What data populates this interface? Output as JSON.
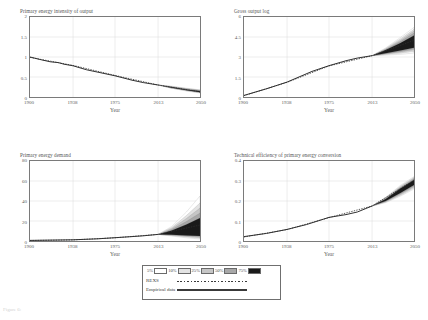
{
  "figure": {
    "caption": "Figure 6:"
  },
  "legend": {
    "name": "fan-chart-legend",
    "percentiles": [
      {
        "label": "5%",
        "color": "#ffffff"
      },
      {
        "label": "10%",
        "color": "#e3e3e3"
      },
      {
        "label": "25%",
        "color": "#c6c6c6"
      },
      {
        "label": "50%",
        "color": "#a8a8a8"
      },
      {
        "label": "75%",
        "color": "#1a1a1a"
      }
    ],
    "series": [
      {
        "label": "REXS",
        "style": "dotted"
      },
      {
        "label": "Empirical data",
        "style": "solid"
      }
    ]
  },
  "chart_data": [
    {
      "id": "primary-energy-intensity",
      "type": "line",
      "title": "Primary energy intensity of output",
      "xlabel": "Year",
      "ylabel": "",
      "xlim": [
        1900,
        2050
      ],
      "ylim": [
        0,
        2
      ],
      "xticks": [
        1900,
        1938,
        1975,
        2013,
        2050
      ],
      "yticks": [
        "0",
        "0.5",
        "1",
        "1.5",
        "2"
      ],
      "grid": true,
      "legend": "external",
      "series": [
        {
          "name": "Empirical data",
          "style": "solid",
          "x": [
            1900,
            1910,
            1918,
            1925,
            1930,
            1938,
            1950,
            1960,
            1975,
            1990,
            2000,
            2013
          ],
          "values": [
            1.0,
            0.93,
            0.88,
            0.86,
            0.82,
            0.78,
            0.68,
            0.62,
            0.53,
            0.42,
            0.36,
            0.3
          ]
        },
        {
          "name": "REXS",
          "style": "dotted",
          "x": [
            1900,
            1938,
            1975,
            2013,
            2050
          ],
          "values": [
            0.99,
            0.79,
            0.54,
            0.3,
            0.13
          ]
        }
      ],
      "fan": {
        "x": [
          2013,
          2025,
          2038,
          2050
        ],
        "bands": {
          "p75": {
            "lower": [
              0.3,
              0.23,
              0.17,
              0.12
            ],
            "upper": [
              0.3,
              0.25,
              0.19,
              0.15
            ]
          },
          "p50": {
            "lower": [
              0.3,
              0.23,
              0.17,
              0.12
            ],
            "upper": [
              0.3,
              0.25,
              0.2,
              0.16
            ]
          },
          "p25": {
            "lower": [
              0.3,
              0.22,
              0.16,
              0.11
            ],
            "upper": [
              0.3,
              0.26,
              0.21,
              0.17
            ]
          },
          "p10": {
            "lower": [
              0.3,
              0.22,
              0.16,
              0.11
            ],
            "upper": [
              0.3,
              0.26,
              0.21,
              0.17
            ]
          },
          "p5": {
            "lower": [
              0.3,
              0.22,
              0.15,
              0.1
            ],
            "upper": [
              0.3,
              0.27,
              0.22,
              0.18
            ]
          }
        }
      }
    },
    {
      "id": "gross-output-log",
      "type": "line",
      "title": "Gross output log",
      "xlabel": "Year",
      "ylabel": "",
      "xlim": [
        1900,
        2050
      ],
      "ylim": [
        0,
        6
      ],
      "xticks": [
        1900,
        1938,
        1975,
        2013,
        2050
      ],
      "yticks": [
        "0",
        "1.5",
        "3",
        "4.5",
        "6"
      ],
      "grid": true,
      "legend": "external",
      "series": [
        {
          "name": "Empirical data",
          "style": "solid",
          "x": [
            1900,
            1920,
            1938,
            1960,
            1975,
            1990,
            2000,
            2013
          ],
          "values": [
            0.12,
            0.62,
            1.12,
            1.92,
            2.35,
            2.72,
            2.92,
            3.1
          ]
        },
        {
          "name": "REXS",
          "style": "dotted",
          "x": [
            1900,
            1938,
            1975,
            2013,
            2050
          ],
          "values": [
            0.1,
            1.1,
            2.33,
            3.1,
            4.25
          ]
        }
      ],
      "fan": {
        "x": [
          2013,
          2025,
          2038,
          2050
        ],
        "bands": {
          "p75": {
            "lower": [
              3.1,
              3.28,
              3.48,
              3.7
            ],
            "upper": [
              3.1,
              3.52,
              4.05,
              4.62
            ]
          },
          "p50": {
            "lower": [
              3.1,
              3.25,
              3.42,
              3.6
            ],
            "upper": [
              3.1,
              3.56,
              4.16,
              4.8
            ]
          },
          "p25": {
            "lower": [
              3.1,
              3.22,
              3.36,
              3.52
            ],
            "upper": [
              3.1,
              3.6,
              4.26,
              4.95
            ]
          },
          "p10": {
            "lower": [
              3.1,
              3.18,
              3.28,
              3.42
            ],
            "upper": [
              3.1,
              3.64,
              4.36,
              5.08
            ]
          },
          "p5": {
            "lower": [
              3.1,
              3.14,
              3.2,
              3.3
            ],
            "upper": [
              3.1,
              3.68,
              4.46,
              5.22
            ]
          }
        }
      }
    },
    {
      "id": "primary-energy-demand",
      "type": "line",
      "title": "Primary energy demand",
      "xlabel": "Year",
      "ylabel": "",
      "xlim": [
        1900,
        2050
      ],
      "ylim": [
        0,
        80
      ],
      "xticks": [
        1900,
        1938,
        1975,
        2013,
        2050
      ],
      "yticks": [
        "0",
        "20",
        "40",
        "60",
        "80"
      ],
      "grid": true,
      "legend": "external",
      "series": [
        {
          "name": "Empirical data",
          "style": "solid",
          "x": [
            1900,
            1938,
            1960,
            1975,
            1990,
            2000,
            2013
          ],
          "values": [
            0.6,
            1.2,
            2.2,
            3.3,
            4.4,
            5.2,
            6.6
          ]
        },
        {
          "name": "REXS",
          "style": "dotted",
          "x": [
            1900,
            1938,
            1975,
            2013,
            2050
          ],
          "values": [
            0.5,
            1.1,
            3.2,
            6.6,
            16.0
          ]
        }
      ],
      "fan": {
        "x": [
          2013,
          2025,
          2038,
          2050
        ],
        "bands": {
          "p75": {
            "lower": [
              6.6,
              6.2,
              5.6,
              5.0
            ],
            "upper": [
              6.6,
              10.5,
              16.5,
              23.0
            ]
          },
          "p50": {
            "lower": [
              6.6,
              6.0,
              5.2,
              4.4
            ],
            "upper": [
              6.6,
              11.5,
              19.5,
              28.0
            ]
          },
          "p25": {
            "lower": [
              6.6,
              5.7,
              4.6,
              3.6
            ],
            "upper": [
              6.6,
              12.5,
              22.5,
              33.0
            ]
          },
          "p10": {
            "lower": [
              6.6,
              5.4,
              4.0,
              2.8
            ],
            "upper": [
              6.6,
              13.5,
              25.5,
              38.0
            ]
          },
          "p5": {
            "lower": [
              6.6,
              5.0,
              3.2,
              2.0
            ],
            "upper": [
              6.6,
              14.5,
              29.0,
              45.0
            ]
          }
        }
      }
    },
    {
      "id": "technical-efficiency",
      "type": "line",
      "title": "Technical efficiency of primary energy conversion",
      "xlabel": "Year",
      "ylabel": "",
      "xlim": [
        1900,
        2050
      ],
      "ylim": [
        0,
        0.4
      ],
      "xticks": [
        1900,
        1938,
        1975,
        2013,
        2050
      ],
      "yticks": [
        "0",
        "0.1",
        "0.2",
        "0.3",
        "0.4"
      ],
      "grid": true,
      "legend": "external",
      "series": [
        {
          "name": "Empirical data",
          "style": "solid",
          "x": [
            1900,
            1920,
            1938,
            1955,
            1975,
            1990,
            2000,
            2013
          ],
          "values": [
            0.022,
            0.038,
            0.058,
            0.082,
            0.118,
            0.132,
            0.145,
            0.175
          ]
        },
        {
          "name": "REXS",
          "style": "dotted",
          "x": [
            1900,
            1938,
            1975,
            2013,
            2050
          ],
          "values": [
            0.02,
            0.057,
            0.117,
            0.175,
            0.305
          ]
        }
      ],
      "fan": {
        "x": [
          2013,
          2025,
          2038,
          2050
        ],
        "bands": {
          "p75": {
            "lower": [
              0.175,
              0.2,
              0.24,
              0.28
            ],
            "upper": [
              0.175,
              0.21,
              0.262,
              0.305
            ]
          },
          "p50": {
            "lower": [
              0.175,
              0.198,
              0.236,
              0.275
            ],
            "upper": [
              0.175,
              0.212,
              0.266,
              0.31
            ]
          },
          "p25": {
            "lower": [
              0.175,
              0.196,
              0.232,
              0.27
            ],
            "upper": [
              0.175,
              0.214,
              0.27,
              0.315
            ]
          },
          "p10": {
            "lower": [
              0.175,
              0.194,
              0.228,
              0.265
            ],
            "upper": [
              0.175,
              0.216,
              0.274,
              0.318
            ]
          },
          "p5": {
            "lower": [
              0.175,
              0.192,
              0.224,
              0.26
            ],
            "upper": [
              0.175,
              0.218,
              0.278,
              0.322
            ]
          }
        }
      }
    }
  ]
}
